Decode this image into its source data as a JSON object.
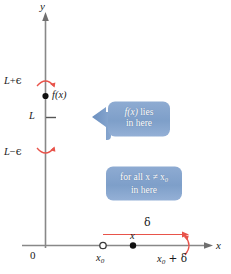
{
  "figure": {
    "background_color": "#ffffff",
    "axis_color": "#808080",
    "accent_red": "#e8534a",
    "callout_fill": "#7e9fc9",
    "callout_arrow": "#6e92c0"
  },
  "axes": {
    "y_label": "y",
    "x_label": "x",
    "origin_label": "0"
  },
  "y_axis_marks": [
    {
      "id": "l-plus-eps",
      "label_main": "L",
      "label_op": "+",
      "label_eps": "ϵ",
      "y_px": 82,
      "arc": "up"
    },
    {
      "id": "l",
      "label_main": "L",
      "label_op": "",
      "label_eps": "",
      "y_px": 117,
      "arc": "none"
    },
    {
      "id": "l-minus-eps",
      "label_main": "L",
      "label_op": "−",
      "label_eps": "ϵ",
      "y_px": 152,
      "arc": "down"
    }
  ],
  "points": [
    {
      "id": "fx-point",
      "label": "f(x)",
      "kind": "filled",
      "x_px": 44,
      "y_px": 96
    },
    {
      "id": "x0-point",
      "label": "x",
      "label_sub": "0",
      "kind": "open",
      "x_px": 103,
      "y_px": 245
    },
    {
      "id": "x-point",
      "label": "x",
      "label_sub": "",
      "kind": "filled",
      "x_px": 133,
      "y_px": 245
    },
    {
      "id": "x0-plus-delta",
      "label": "x",
      "label_sub": "0",
      "label_rest": " + δ",
      "kind": "arc",
      "x_px": 188,
      "y_px": 245
    }
  ],
  "callouts": [
    {
      "id": "fx-lies-callout",
      "line1_a": "f(x)",
      "line1_b": " lies",
      "line2": "in here",
      "direction": "left"
    },
    {
      "id": "for-all-x-callout",
      "line1_a": "for all x",
      "line1_b": " ≠ x",
      "line1_sub": "0",
      "line2": "in here",
      "direction": "down"
    }
  ],
  "delta_measure": {
    "label": "δ",
    "from_px": 103,
    "to_px": 188,
    "y_px": 226
  }
}
